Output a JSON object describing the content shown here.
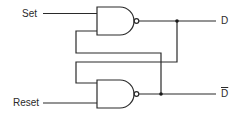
{
  "diagram": {
    "type": "SR latch (cross-coupled NAND gates)",
    "inputs": {
      "set_label": "Set",
      "reset_label": "Reset"
    },
    "outputs": {
      "q_label": "D",
      "q_bar_label": "D"
    },
    "gates": [
      {
        "id": "nand-top",
        "kind": "NAND",
        "inputs": [
          "Set",
          "D̄ (feedback)"
        ],
        "output": "D"
      },
      {
        "id": "nand-bottom",
        "kind": "NAND",
        "inputs": [
          "D (feedback)",
          "Reset"
        ],
        "output": "D̄"
      }
    ],
    "colors": {
      "line": "#2a2a2a",
      "background": "#ffffff"
    }
  }
}
